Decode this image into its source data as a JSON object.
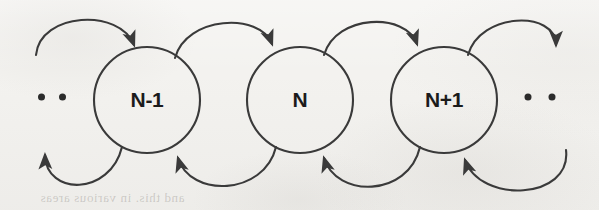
{
  "figure": {
    "kind": "state-transition-diagram",
    "width": 599,
    "height": 210,
    "background_color": "#f3f2ef",
    "ink_color": "#3a3a3a",
    "label_color": "#1b1b1b"
  },
  "states": [
    {
      "id": "n-minus-1",
      "label": "N-1",
      "cx": 147,
      "cy": 100,
      "r": 53
    },
    {
      "id": "n",
      "label": "N",
      "cx": 300,
      "cy": 100,
      "r": 53
    },
    {
      "id": "n-plus-1",
      "label": "N+1",
      "cx": 444,
      "cy": 100,
      "r": 53
    }
  ],
  "ellipses": [
    {
      "id": "left-ellipsis",
      "cx": 52,
      "cy": 97,
      "dots": 2
    },
    {
      "id": "right-ellipsis",
      "cx": 540,
      "cy": 97,
      "dots": 2
    }
  ],
  "transitions_forward": [
    {
      "id": "fwd-from-left-ellipsis",
      "from": "…",
      "to": "N-1",
      "direction": "right",
      "side": "top"
    },
    {
      "id": "fwd-n-minus-1-to-n",
      "from": "N-1",
      "to": "N",
      "direction": "right",
      "side": "top"
    },
    {
      "id": "fwd-n-to-n-plus-1",
      "from": "N",
      "to": "N+1",
      "direction": "right",
      "side": "top"
    },
    {
      "id": "fwd-n-plus-1-to-right-ellipsis",
      "from": "N+1",
      "to": "…",
      "direction": "right",
      "side": "top"
    }
  ],
  "transitions_backward": [
    {
      "id": "bwd-n-minus-1-to-left-ellipsis",
      "from": "N-1",
      "to": "…",
      "direction": "left",
      "side": "bottom"
    },
    {
      "id": "bwd-n-to-n-minus-1",
      "from": "N",
      "to": "N-1",
      "direction": "left",
      "side": "bottom"
    },
    {
      "id": "bwd-n-plus-1-to-n",
      "from": "N+1",
      "to": "N",
      "direction": "left",
      "side": "bottom"
    },
    {
      "id": "bwd-right-ellipsis-to-n-plus-1",
      "from": "…",
      "to": "N+1",
      "direction": "left",
      "side": "bottom"
    }
  ],
  "bleed_through": {
    "line": "and this. in various areas"
  }
}
